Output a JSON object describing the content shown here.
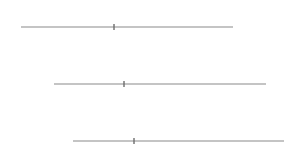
{
  "diagram": {
    "type": "staggered-number-lines",
    "line_color": "#8a8a8a",
    "tick_color": "#6e6e6e",
    "lines": [
      {
        "x1": 21,
        "x2": 233,
        "y": 27,
        "tick_x": 114
      },
      {
        "x1": 54,
        "x2": 266,
        "y": 84,
        "tick_x": 124
      },
      {
        "x1": 73,
        "x2": 284,
        "y": 141,
        "tick_x": 134
      }
    ]
  }
}
